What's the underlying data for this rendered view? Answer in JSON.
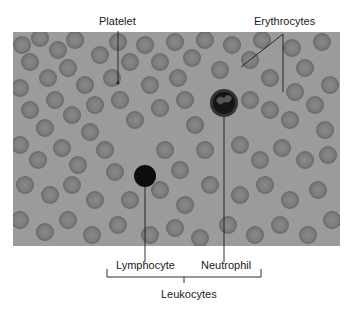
{
  "figure": {
    "micrograph": {
      "background_color": "#9a9a9a",
      "cell_color": "#7a7a7a",
      "cell_rim_color": "#6a6a6a"
    },
    "labels": {
      "platelet": "Platelet",
      "erythrocytes": "Erythrocytes",
      "lymphocyte": "Lymphocyte",
      "neutrophil": "Neutrophil",
      "leukocytes": "Leukocytes"
    }
  }
}
